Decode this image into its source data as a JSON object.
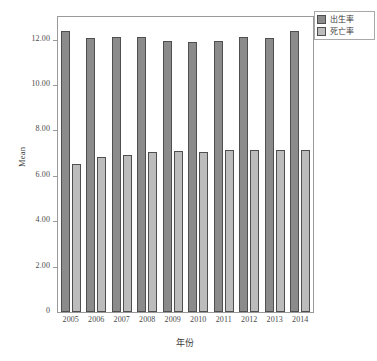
{
  "chart_data": {
    "type": "bar",
    "title": "",
    "subtitle": "",
    "xlabel": "年份",
    "ylabel": "Mean",
    "categories": [
      "2005",
      "2006",
      "2007",
      "2008",
      "2009",
      "2010",
      "2011",
      "2012",
      "2013",
      "2014"
    ],
    "series": [
      {
        "name": "出生率",
        "color": "#8b8b8b",
        "values": [
          12.4,
          12.09,
          12.1,
          12.1,
          11.95,
          11.9,
          11.93,
          12.1,
          12.08,
          12.37
        ]
      },
      {
        "name": "死亡率",
        "color": "#bcbcbc",
        "values": [
          6.51,
          6.81,
          6.93,
          7.06,
          7.08,
          7.07,
          7.14,
          7.16,
          7.16,
          7.16
        ]
      }
    ],
    "ylim": [
      0,
      13.0
    ],
    "yticks": [
      0,
      2,
      4,
      6,
      8,
      10,
      12
    ],
    "ytick_labels": [
      "0",
      "2.00",
      "4.00",
      "6.00",
      "8.00",
      "10.00",
      "12.00"
    ],
    "grid": false,
    "legend_position": "top-right",
    "legend_entries": [
      "出生率",
      "死亡率"
    ]
  },
  "axes": {
    "y_title": "Mean",
    "x_title": "年份"
  }
}
